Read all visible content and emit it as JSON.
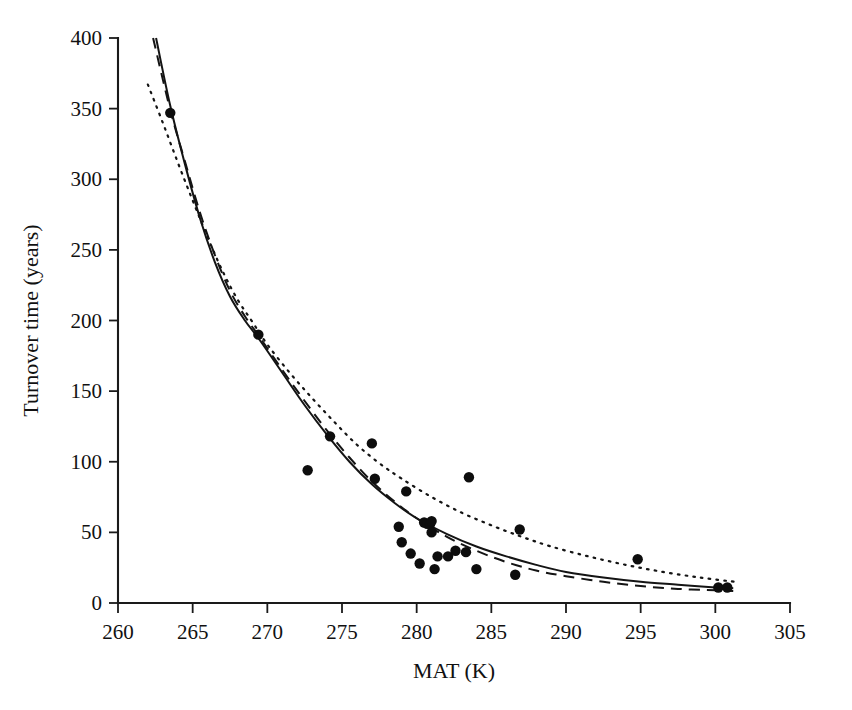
{
  "chart_data": {
    "type": "scatter",
    "title": "",
    "xlabel": "MAT (K)",
    "ylabel": "Turnover time (years)",
    "xlim": [
      260,
      305
    ],
    "ylim": [
      0,
      400
    ],
    "xticks": [
      260,
      265,
      270,
      275,
      280,
      285,
      290,
      295,
      300,
      305
    ],
    "yticks": [
      0,
      50,
      100,
      150,
      200,
      250,
      300,
      350,
      400
    ],
    "xtick_labels": [
      "260",
      "265",
      "270",
      "275",
      "280",
      "285",
      "290",
      "295",
      "300",
      "305"
    ],
    "ytick_labels": [
      "0",
      "50",
      "100",
      "150",
      "200",
      "250",
      "300",
      "350",
      "400"
    ],
    "grid": false,
    "legend": "none",
    "points": [
      {
        "x": 263.5,
        "y": 347
      },
      {
        "x": 269.4,
        "y": 190
      },
      {
        "x": 272.7,
        "y": 94
      },
      {
        "x": 274.2,
        "y": 118
      },
      {
        "x": 277.0,
        "y": 113
      },
      {
        "x": 277.2,
        "y": 88
      },
      {
        "x": 278.8,
        "y": 54
      },
      {
        "x": 279.0,
        "y": 43
      },
      {
        "x": 279.3,
        "y": 79
      },
      {
        "x": 279.6,
        "y": 35
      },
      {
        "x": 280.2,
        "y": 28
      },
      {
        "x": 280.5,
        "y": 57
      },
      {
        "x": 280.7,
        "y": 56
      },
      {
        "x": 280.9,
        "y": 56
      },
      {
        "x": 281.0,
        "y": 58
      },
      {
        "x": 281.0,
        "y": 50
      },
      {
        "x": 281.2,
        "y": 24
      },
      {
        "x": 281.4,
        "y": 33
      },
      {
        "x": 282.1,
        "y": 33
      },
      {
        "x": 282.6,
        "y": 37
      },
      {
        "x": 283.3,
        "y": 36
      },
      {
        "x": 283.5,
        "y": 89
      },
      {
        "x": 284.0,
        "y": 24
      },
      {
        "x": 286.6,
        "y": 20
      },
      {
        "x": 286.9,
        "y": 52
      },
      {
        "x": 294.8,
        "y": 31
      },
      {
        "x": 300.2,
        "y": 11
      },
      {
        "x": 300.8,
        "y": 11
      }
    ],
    "series": [
      {
        "name": "solid-fit",
        "style": "solid",
        "x_start": 262.55,
        "x_end": 301.2,
        "y_at_x_start": 400,
        "points": [
          {
            "x": 262.55,
            "y": 400
          },
          {
            "x": 263.5,
            "y": 352
          },
          {
            "x": 264.5,
            "y": 310
          },
          {
            "x": 265.5,
            "y": 272
          },
          {
            "x": 266.5,
            "y": 241
          },
          {
            "x": 267.5,
            "y": 217
          },
          {
            "x": 268.5,
            "y": 200
          },
          {
            "x": 269.5,
            "y": 186
          },
          {
            "x": 271.0,
            "y": 163
          },
          {
            "x": 272.5,
            "y": 140
          },
          {
            "x": 274.0,
            "y": 119
          },
          {
            "x": 275.5,
            "y": 100
          },
          {
            "x": 277.0,
            "y": 84
          },
          {
            "x": 278.5,
            "y": 71
          },
          {
            "x": 280.0,
            "y": 60
          },
          {
            "x": 282.0,
            "y": 49
          },
          {
            "x": 284.0,
            "y": 40
          },
          {
            "x": 286.0,
            "y": 33
          },
          {
            "x": 288.0,
            "y": 27
          },
          {
            "x": 290.0,
            "y": 22
          },
          {
            "x": 292.5,
            "y": 18
          },
          {
            "x": 295.0,
            "y": 15
          },
          {
            "x": 297.5,
            "y": 13
          },
          {
            "x": 300.0,
            "y": 11
          },
          {
            "x": 301.2,
            "y": 10.5
          }
        ]
      },
      {
        "name": "dashed-fit",
        "style": "dashed",
        "x_start": 262.35,
        "x_end": 301.2,
        "y_at_x_start": 400,
        "points": [
          {
            "x": 262.35,
            "y": 400
          },
          {
            "x": 263.5,
            "y": 349
          },
          {
            "x": 264.5,
            "y": 312
          },
          {
            "x": 265.5,
            "y": 276
          },
          {
            "x": 266.5,
            "y": 246
          },
          {
            "x": 267.5,
            "y": 221
          },
          {
            "x": 268.5,
            "y": 203
          },
          {
            "x": 269.5,
            "y": 188
          },
          {
            "x": 271.0,
            "y": 165
          },
          {
            "x": 272.5,
            "y": 143
          },
          {
            "x": 274.0,
            "y": 122
          },
          {
            "x": 275.5,
            "y": 103
          },
          {
            "x": 277.0,
            "y": 86
          },
          {
            "x": 278.5,
            "y": 72
          },
          {
            "x": 280.0,
            "y": 60
          },
          {
            "x": 282.0,
            "y": 47
          },
          {
            "x": 284.0,
            "y": 37
          },
          {
            "x": 286.0,
            "y": 29
          },
          {
            "x": 288.0,
            "y": 23
          },
          {
            "x": 290.0,
            "y": 19
          },
          {
            "x": 292.5,
            "y": 15
          },
          {
            "x": 295.0,
            "y": 12
          },
          {
            "x": 297.5,
            "y": 10
          },
          {
            "x": 300.0,
            "y": 9
          },
          {
            "x": 301.2,
            "y": 8.5
          }
        ]
      },
      {
        "name": "dotted-fit",
        "style": "dotted",
        "x_start": 262.0,
        "x_end": 301.3,
        "y_at_x_start": 367,
        "points": [
          {
            "x": 262.0,
            "y": 367
          },
          {
            "x": 263.0,
            "y": 340
          },
          {
            "x": 264.0,
            "y": 312
          },
          {
            "x": 265.0,
            "y": 285
          },
          {
            "x": 266.0,
            "y": 259
          },
          {
            "x": 267.0,
            "y": 235
          },
          {
            "x": 268.0,
            "y": 215
          },
          {
            "x": 269.0,
            "y": 199
          },
          {
            "x": 270.0,
            "y": 183
          },
          {
            "x": 271.5,
            "y": 163
          },
          {
            "x": 273.0,
            "y": 145
          },
          {
            "x": 274.5,
            "y": 128
          },
          {
            "x": 276.0,
            "y": 112
          },
          {
            "x": 277.5,
            "y": 99
          },
          {
            "x": 279.0,
            "y": 88
          },
          {
            "x": 281.0,
            "y": 75
          },
          {
            "x": 283.0,
            "y": 64
          },
          {
            "x": 285.0,
            "y": 55
          },
          {
            "x": 287.0,
            "y": 47
          },
          {
            "x": 289.0,
            "y": 40
          },
          {
            "x": 291.5,
            "y": 33
          },
          {
            "x": 294.0,
            "y": 27
          },
          {
            "x": 296.5,
            "y": 22
          },
          {
            "x": 299.0,
            "y": 18
          },
          {
            "x": 301.3,
            "y": 15
          }
        ]
      }
    ]
  },
  "figure": {
    "point_radius": 5.2
  }
}
